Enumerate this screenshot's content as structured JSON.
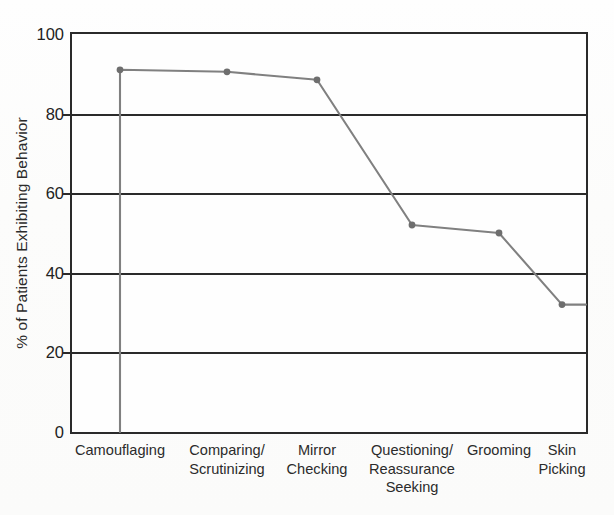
{
  "figure": {
    "background_color": "#fdfdfc",
    "axis_color": "#2a2a2a",
    "series_color": "#808080"
  },
  "chart_data": {
    "type": "line",
    "title": "",
    "subtitle": "",
    "xlabel": "",
    "ylabel": "% of Patients Exhibiting Behavior",
    "categories": [
      "Camouflaging",
      "Comparing/\nScrutinizing",
      "Mirror\nChecking",
      "Questioning/\nReassurance\nSeeking",
      "Grooming",
      "Skin\nPicking"
    ],
    "values": [
      91,
      90.5,
      88.5,
      52,
      50,
      32
    ],
    "ylim": [
      0,
      100
    ],
    "ytick_labels": [
      "0",
      "20",
      "40",
      "60",
      "80",
      "100"
    ],
    "yticks": [
      0,
      20,
      40,
      60,
      80,
      100
    ],
    "grid": true,
    "grid_axis": "y",
    "legend": "none",
    "marker": "circle",
    "line_color": "#808080",
    "marker_color": "#6e6e6e"
  }
}
